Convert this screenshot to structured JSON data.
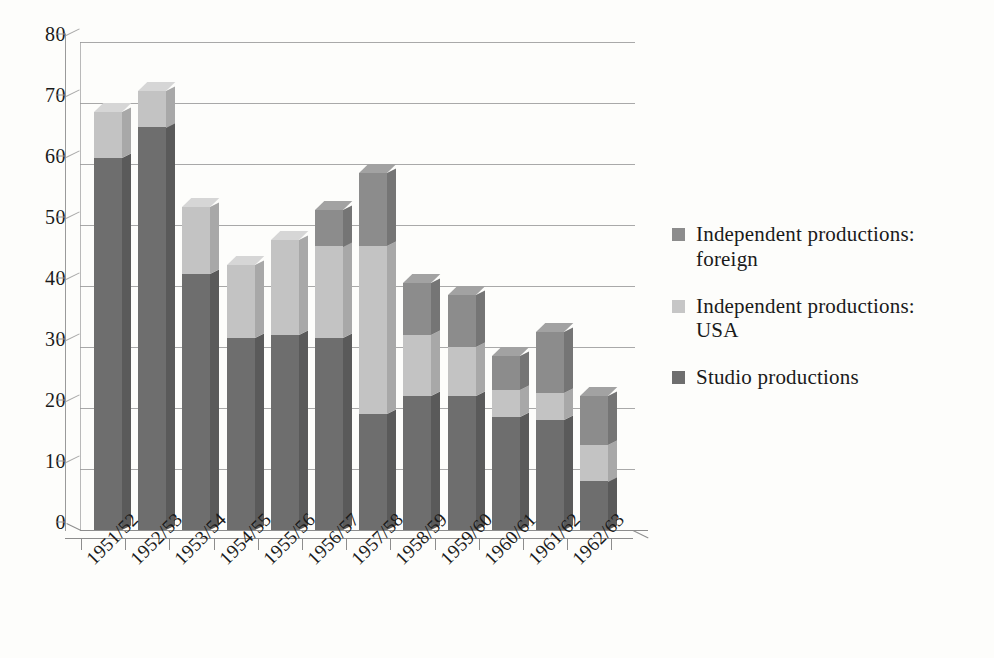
{
  "chart_data": {
    "type": "bar",
    "subtype": "stacked-bar-3d",
    "title": "",
    "xlabel": "",
    "ylabel": "",
    "ylim": [
      0,
      80
    ],
    "yticks": [
      0,
      10,
      20,
      30,
      40,
      50,
      60,
      70,
      80
    ],
    "grid": true,
    "legend_position": "right",
    "stacked": true,
    "stack_order_bottom_to_top": [
      "Studio productions",
      "Independent productions: USA",
      "Independent productions: foreign"
    ],
    "categories": [
      "1951/52",
      "1952/53",
      "1953/54",
      "1954/55",
      "1955/56",
      "1956/57",
      "1957/58",
      "1958/59",
      "1959/60",
      "1960/61",
      "1961/62",
      "1962/63"
    ],
    "series": [
      {
        "name": "Studio productions",
        "color": "#6e6e6e",
        "values": [
          61,
          66,
          42,
          31.5,
          32,
          31.5,
          19,
          22,
          22,
          18.5,
          18,
          8
        ]
      },
      {
        "name": "Independent productions: USA",
        "color": "#c3c3c3",
        "values": [
          7.5,
          6,
          11,
          12,
          15.5,
          15,
          27.5,
          10,
          8,
          4.5,
          4.5,
          6
        ]
      },
      {
        "name": "Independent productions: foreign",
        "color": "#8c8c8c",
        "values": [
          0,
          0,
          0,
          0,
          0,
          6,
          12,
          8.5,
          8.5,
          5.5,
          10,
          8
        ]
      }
    ],
    "totals": [
      68.5,
      72,
      53,
      43.5,
      47.5,
      52.5,
      58.5,
      40.5,
      38.5,
      28.5,
      32.5,
      22
    ]
  },
  "legend": {
    "items": [
      {
        "label": "Independent productions: foreign",
        "color": "#8c8c8c"
      },
      {
        "label": "Independent productions: USA",
        "color": "#c6c6c6"
      },
      {
        "label": "Studio productions",
        "color": "#6e6e6e"
      }
    ]
  },
  "colors": {
    "background": "#fdfdfb",
    "grid": "#9a9a9a",
    "axis": "#8d8d8d",
    "text": "#1a1a1a",
    "studio": "#6e6e6e",
    "studio_side": "#5a5a5a",
    "studio_top": "#8a8a8a",
    "usa": "#c3c3c3",
    "usa_side": "#a8a8a8",
    "usa_top": "#d6d6d6",
    "foreign": "#8c8c8c",
    "foreign_side": "#757575",
    "foreign_top": "#a2a2a2"
  }
}
